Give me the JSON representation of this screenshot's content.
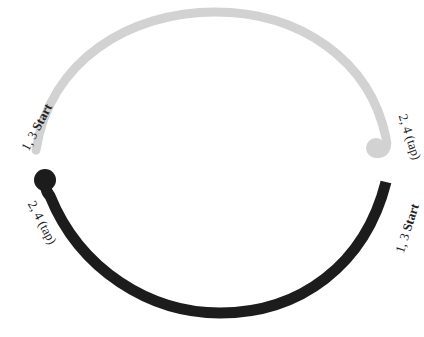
{
  "diagram": {
    "arcs": [
      {
        "id": "top-arc",
        "color": "#d2d2d2",
        "start_label_num": "1, 3",
        "start_label_word": "Start",
        "end_label": "2, 4 (tap)"
      },
      {
        "id": "bottom-arc",
        "color": "#1c1c1c",
        "start_label_num": "1, 3",
        "start_label_word": "Start",
        "end_label": "2, 4 (tap)"
      }
    ]
  }
}
